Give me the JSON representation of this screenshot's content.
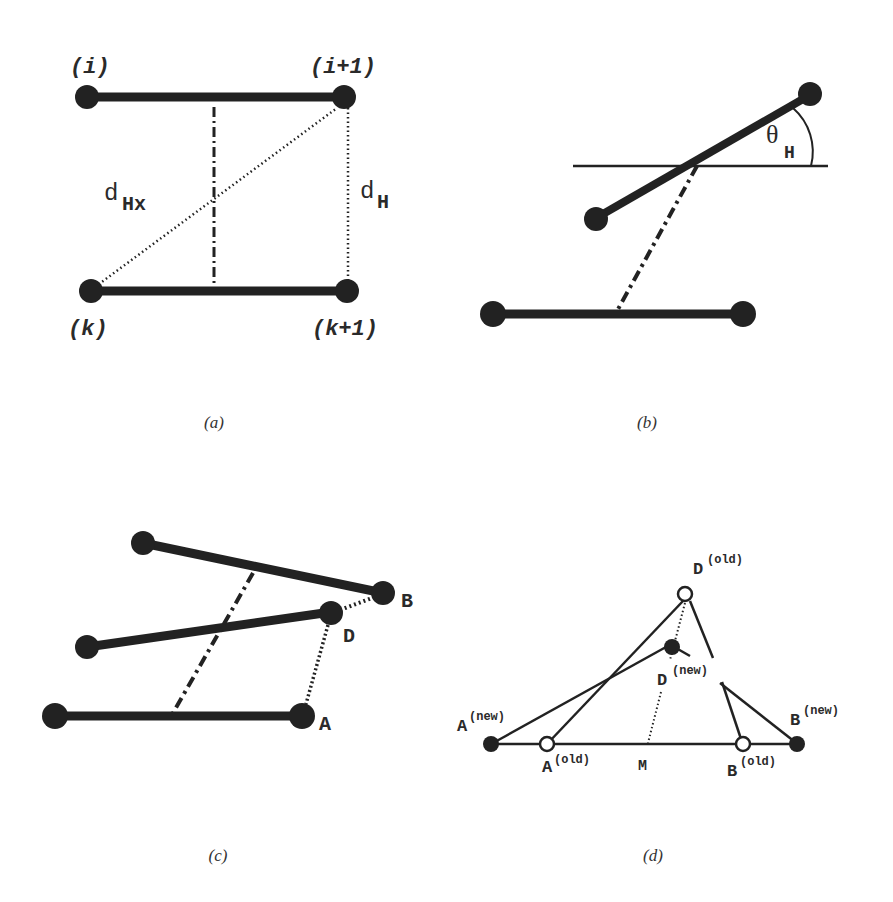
{
  "figure": {
    "panels": [
      {
        "id": "a",
        "caption": "(a)",
        "labels": {
          "i": "(i)",
          "i_plus_1": "(i+1)",
          "k": "(k)",
          "k_plus_1": "(k+1)",
          "d_Hx_main": "d",
          "d_Hx_sub": "Hx",
          "d_H_main": "d",
          "d_H_sub": "H"
        }
      },
      {
        "id": "b",
        "caption": "(b)",
        "labels": {
          "theta_main": "θ",
          "theta_sub": "H"
        }
      },
      {
        "id": "c",
        "caption": "(c)",
        "labels": {
          "A": "A",
          "B": "B",
          "D": "D"
        }
      },
      {
        "id": "d",
        "caption": "(d)",
        "labels": {
          "A_new_main": "A",
          "A_new_sup": "(new)",
          "A_old_main": "A",
          "A_old_sup": "(old)",
          "B_new_main": "B",
          "B_new_sup": "(new)",
          "B_old_main": "B",
          "B_old_sup": "(old)",
          "D_old_main": "D",
          "D_old_sup": "(old)",
          "D_new_main": "D",
          "D_new_sup": "(new)",
          "M": "M"
        }
      }
    ],
    "colors": {
      "stroke": "#222222",
      "node": "#222222",
      "background": "#ffffff"
    }
  }
}
